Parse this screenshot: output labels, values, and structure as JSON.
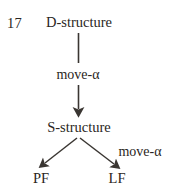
{
  "figure": {
    "item_number": "17",
    "nodes": {
      "d_structure": "D-structure",
      "s_structure": "S-structure",
      "pf": "PF",
      "lf": "LF"
    },
    "edge_labels": {
      "move_alpha_top": "move-α",
      "move_alpha_lf": "move-α"
    },
    "colors": {
      "background": "#ffffff",
      "text": "#2a2622",
      "stroke": "#3a3632"
    }
  }
}
